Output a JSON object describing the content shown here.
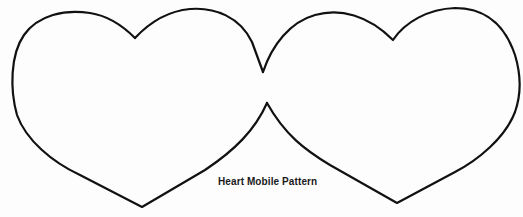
{
  "figure": {
    "caption": "Heart Mobile Pattern",
    "stroke_color": "#111111",
    "background": "#fdfdfd",
    "shapes": [
      {
        "name": "left-heart"
      },
      {
        "name": "right-heart"
      }
    ]
  }
}
